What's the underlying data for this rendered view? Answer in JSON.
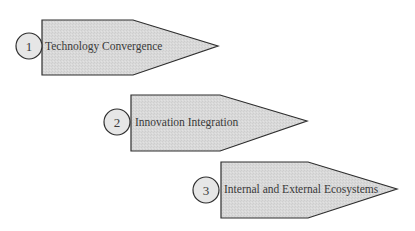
{
  "diagram": {
    "type": "stepped-arrows",
    "fill_color": "#d9d9d9",
    "stroke_color": "#2e2e2e",
    "text_color": "#3a3a3a",
    "steps": [
      {
        "number": "1",
        "label": "Technology Convergence",
        "circle": {
          "cx": 29,
          "cy": 46,
          "r": 13
        },
        "arrow": "42,20 133,20 218,46 133,75 42,75",
        "label_pos": {
          "x": 45,
          "y": 50
        },
        "num_pos": {
          "x": 29,
          "y": 51
        }
      },
      {
        "number": "2",
        "label": "Innovation Integration",
        "circle": {
          "cx": 117,
          "cy": 122,
          "r": 13
        },
        "arrow": "131,95 220,95 307,121 220,151 131,151",
        "label_pos": {
          "x": 135,
          "y": 126
        },
        "num_pos": {
          "x": 117,
          "y": 127
        }
      },
      {
        "number": "3",
        "label": "Internal and External Ecosystems",
        "circle": {
          "cx": 206,
          "cy": 190,
          "r": 13
        },
        "arrow": "221,162 308,162 397,189 308,218 221,218",
        "label_pos": {
          "x": 224,
          "y": 193
        },
        "num_pos": {
          "x": 206,
          "y": 195
        }
      }
    ]
  }
}
